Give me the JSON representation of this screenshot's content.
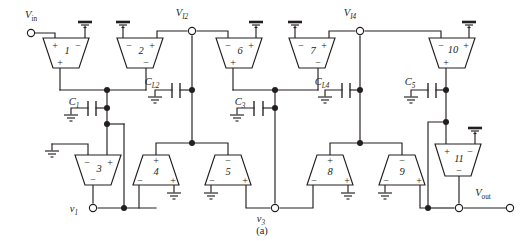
{
  "figure": {
    "caption": "(a)",
    "background": "#ffffff",
    "ink_color": "#231f20"
  },
  "ports": [
    {
      "id": "vin",
      "label": "V",
      "sub": "in",
      "sub_italic": false,
      "x": 30,
      "y": 33,
      "label_x": 31,
      "label_y": 18
    },
    {
      "id": "vout",
      "label": "V",
      "sub": "out",
      "sub_italic": false,
      "x": 512,
      "y": 208,
      "label_x": 494,
      "label_y": 196
    },
    {
      "id": "vi2",
      "label": "V",
      "sub": "I2",
      "sub_italic": true,
      "x": 192,
      "y": 31,
      "label_x": 194,
      "label_y": 16
    },
    {
      "id": "vi4",
      "label": "V",
      "sub": "I4",
      "sub_italic": true,
      "x": 360,
      "y": 31,
      "label_x": 362,
      "label_y": 16
    },
    {
      "id": "v1",
      "label": "v",
      "sub": "1",
      "sub_italic": true,
      "x": 93,
      "y": 208,
      "label_x": 78,
      "label_y": 212
    },
    {
      "id": "v3",
      "label": "v",
      "sub": "3",
      "sub_italic": true,
      "x": 275,
      "y": 208,
      "label_x": 266,
      "label_y": 220
    },
    {
      "id": "vout_inner",
      "label": "",
      "sub": "",
      "sub_italic": false,
      "x": 459,
      "y": 208,
      "label_x": 0,
      "label_y": 0
    }
  ],
  "amplifiers": [
    {
      "id": "amp1",
      "number": "1",
      "cx": 66,
      "top_y": 38,
      "bot_y": 68,
      "top_w": 46,
      "bot_w": 26,
      "orient": "down",
      "in_left": "+",
      "in_right": "−",
      "out_sign": "+",
      "out_sign_side": "bottom"
    },
    {
      "id": "amp2",
      "number": "2",
      "cx": 140,
      "top_y": 38,
      "bot_y": 68,
      "top_w": 46,
      "bot_w": 26,
      "orient": "down",
      "in_left": "−",
      "in_right": "+",
      "out_sign": "−",
      "out_sign_side": "bottom"
    },
    {
      "id": "amp6",
      "number": "6",
      "cx": 239,
      "top_y": 38,
      "bot_y": 68,
      "top_w": 46,
      "bot_w": 26,
      "orient": "down",
      "in_left": "−",
      "in_right": "+",
      "out_sign": "+",
      "out_sign_side": "bottom"
    },
    {
      "id": "amp7",
      "number": "7",
      "cx": 312,
      "top_y": 38,
      "bot_y": 68,
      "top_w": 46,
      "bot_w": 26,
      "orient": "down",
      "in_left": "−",
      "in_right": "+",
      "out_sign": "−",
      "out_sign_side": "bottom"
    },
    {
      "id": "amp10",
      "number": "10",
      "cx": 452,
      "top_y": 38,
      "bot_y": 68,
      "top_w": 46,
      "bot_w": 26,
      "orient": "down",
      "in_left": "−",
      "in_right": "+",
      "out_sign": "+",
      "out_sign_side": "bottom"
    },
    {
      "id": "amp3",
      "number": "3",
      "cx": 98,
      "top_y": 155,
      "bot_y": 185,
      "top_w": 46,
      "bot_w": 26,
      "orient": "down",
      "in_left": "−",
      "in_right": "+",
      "out_sign": "−",
      "out_sign_side": "bottom"
    },
    {
      "id": "amp11",
      "number": "11",
      "cx": 458,
      "top_y": 144,
      "bot_y": 176,
      "top_w": 46,
      "bot_w": 26,
      "orient": "down",
      "in_left": "+",
      "in_right": "−",
      "out_sign": "−",
      "out_sign_side": "bottom"
    },
    {
      "id": "amp4",
      "number": "4",
      "cx": 156,
      "top_y": 155,
      "bot_y": 185,
      "top_w": 26,
      "bot_w": 46,
      "orient": "up",
      "in_top": "+",
      "out_left": "−",
      "out_right": "+"
    },
    {
      "id": "amp5",
      "number": "5",
      "cx": 228,
      "top_y": 155,
      "bot_y": 185,
      "top_w": 26,
      "bot_w": 46,
      "orient": "up",
      "in_top": "−",
      "out_left": "−",
      "out_right": "+"
    },
    {
      "id": "amp8",
      "number": "8",
      "cx": 330,
      "top_y": 155,
      "bot_y": 185,
      "top_w": 26,
      "bot_w": 46,
      "orient": "up",
      "in_top": "+",
      "out_left": "−",
      "out_right": "+"
    },
    {
      "id": "amp9",
      "number": "9",
      "cx": 402,
      "top_y": 155,
      "bot_y": 185,
      "top_w": 26,
      "bot_w": 46,
      "orient": "up",
      "in_top": "−",
      "out_left": "−",
      "out_right": "+"
    }
  ],
  "capacitors": [
    {
      "id": "c1",
      "label": "C",
      "sub": "1",
      "label_x": 79,
      "label_y": 105,
      "plate_x": 92,
      "y": 108
    },
    {
      "id": "cl2",
      "label": "C",
      "sub": "L2",
      "label_x": 160,
      "label_y": 85,
      "plate_x": 176,
      "y": 90
    },
    {
      "id": "c3",
      "label": "C",
      "sub": "3",
      "label_x": 245,
      "label_y": 105,
      "plate_x": 258,
      "y": 108
    },
    {
      "id": "cl4",
      "label": "C",
      "sub": "L4",
      "label_x": 330,
      "label_y": 85,
      "plate_x": 346,
      "y": 90
    },
    {
      "id": "c5",
      "label": "C",
      "sub": "5",
      "label_x": 417,
      "label_y": 85,
      "plate_x": 432,
      "y": 90
    }
  ],
  "grounds": [
    {
      "id": "gnd-amp1-in",
      "x": 85,
      "y": 22,
      "dir": "up"
    },
    {
      "id": "gnd-amp2-in",
      "x": 123,
      "y": 22,
      "dir": "up"
    },
    {
      "id": "gnd-amp6-in",
      "x": 256,
      "y": 22,
      "dir": "up"
    },
    {
      "id": "gnd-amp7-in",
      "x": 295,
      "y": 22,
      "dir": "up"
    },
    {
      "id": "gnd-amp10-in",
      "x": 469,
      "y": 22,
      "dir": "up"
    },
    {
      "id": "gnd-amp11-in",
      "x": 475,
      "y": 128,
      "dir": "up"
    },
    {
      "id": "gnd-c1",
      "x": 71,
      "y": 118,
      "dir": "down"
    },
    {
      "id": "gnd-cl2",
      "x": 155,
      "y": 100,
      "dir": "down"
    },
    {
      "id": "gnd-c3",
      "x": 237,
      "y": 118,
      "dir": "down"
    },
    {
      "id": "gnd-cl4",
      "x": 325,
      "y": 100,
      "dir": "down"
    },
    {
      "id": "gnd-c5",
      "x": 411,
      "y": 100,
      "dir": "down"
    },
    {
      "id": "gnd-amp3-left",
      "x": 52,
      "y": 148,
      "dir": "down"
    },
    {
      "id": "gnd-amp4-out",
      "x": 174,
      "y": 196,
      "dir": "down"
    },
    {
      "id": "gnd-amp5-out",
      "x": 211,
      "y": 196,
      "dir": "down"
    },
    {
      "id": "gnd-amp8-out",
      "x": 348,
      "y": 196,
      "dir": "down"
    },
    {
      "id": "gnd-amp9-out",
      "x": 385,
      "y": 196,
      "dir": "down"
    }
  ],
  "junction_dots": [
    {
      "id": "j-c1-top",
      "x": 107,
      "y": 90
    },
    {
      "id": "j-c1-mid",
      "x": 107,
      "y": 108
    },
    {
      "id": "j-c1-bot",
      "x": 107,
      "y": 124
    },
    {
      "id": "j-v1-bus",
      "x": 124,
      "y": 208
    },
    {
      "id": "j-cl2-right",
      "x": 192,
      "y": 90
    },
    {
      "id": "j-vi2-bus",
      "x": 192,
      "y": 143
    },
    {
      "id": "j-c3-top",
      "x": 275,
      "y": 90
    },
    {
      "id": "j-c3-mid",
      "x": 275,
      "y": 108
    },
    {
      "id": "j-cl4-right",
      "x": 360,
      "y": 90
    },
    {
      "id": "j-vi4-bus",
      "x": 360,
      "y": 143
    },
    {
      "id": "j-c5-right",
      "x": 446,
      "y": 90
    },
    {
      "id": "j-c5-branch",
      "x": 446,
      "y": 122
    },
    {
      "id": "j-out-bus",
      "x": 428,
      "y": 208
    }
  ]
}
